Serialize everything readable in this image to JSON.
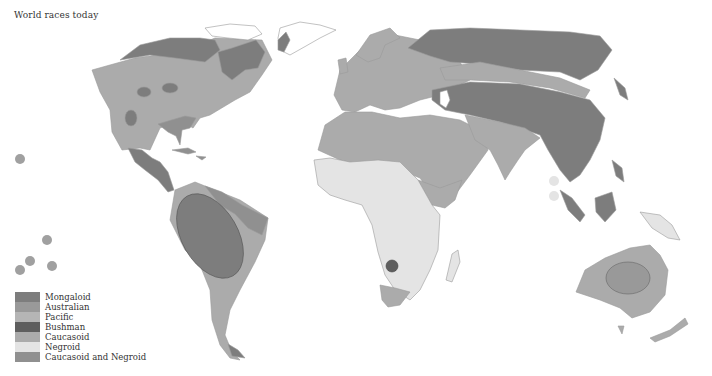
{
  "title": "World races today",
  "colors": {
    "mongaloid": "#7d7d7d",
    "australian": "#999999",
    "pacific": "#b5b5b5",
    "bushman": "#5e5e5e",
    "caucasoid": "#ababab",
    "negroid": "#e4e4e4",
    "caucasoid_and_negroid": "#909090",
    "outline": "#b8b8b8"
  },
  "legend": {
    "items": [
      {
        "label": "Mongaloid",
        "color": "#7d7d7d"
      },
      {
        "label": "Australian",
        "color": "#999999"
      },
      {
        "label": "Pacific",
        "color": "#b5b5b5"
      },
      {
        "label": "Bushman",
        "color": "#5e5e5e"
      },
      {
        "label": "Caucasoid",
        "color": "#ababab"
      },
      {
        "label": "Negroid",
        "color": "#e4e4e4"
      },
      {
        "label": "Caucasoid and Negroid",
        "color": "#909090"
      }
    ]
  },
  "regions": [
    {
      "name": "North America",
      "race": "Caucasoid"
    },
    {
      "name": "Arctic North America",
      "race": "Mongaloid"
    },
    {
      "name": "Central America",
      "race": "Mongaloid"
    },
    {
      "name": "South America",
      "race": "Caucasoid"
    },
    {
      "name": "Amazon basin",
      "race": "Mongaloid"
    },
    {
      "name": "Eastern Brazil",
      "race": "Caucasoid and Negroid"
    },
    {
      "name": "Europe",
      "race": "Caucasoid"
    },
    {
      "name": "North Africa and Middle East",
      "race": "Caucasoid"
    },
    {
      "name": "Sub-Saharan Africa",
      "race": "Negroid"
    },
    {
      "name": "Kalahari",
      "race": "Bushman"
    },
    {
      "name": "Northern and Eastern Asia",
      "race": "Mongaloid"
    },
    {
      "name": "India",
      "race": "Caucasoid"
    },
    {
      "name": "Southeast Asia",
      "race": "Mongaloid"
    },
    {
      "name": "New Guinea",
      "race": "Negroid"
    },
    {
      "name": "Australia",
      "race": "Caucasoid"
    },
    {
      "name": "Central Australia",
      "race": "Australian"
    },
    {
      "name": "Pacific islands",
      "race": "Pacific"
    }
  ]
}
